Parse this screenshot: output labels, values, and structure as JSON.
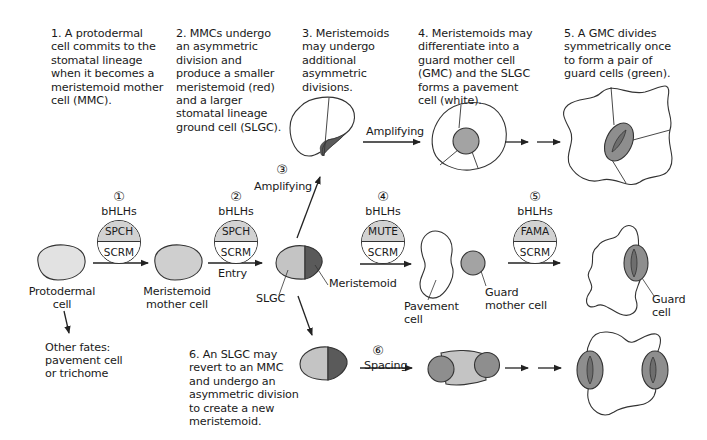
{
  "steps": [
    {
      "id": 1,
      "text": "1. A protodermal\ncell commits to the\nstomatal lineage\nwhen it becomes a\nmeristemoid mother\ncell (MMC)."
    },
    {
      "id": 2,
      "text": "2. MMCs undergo\nan asymmetric\ndivision and\nproduce a smaller\nmeristemoid (red)\nand a larger\nstomatal lineage\nground cell (SLGC)."
    },
    {
      "id": 3,
      "text": "3. Meristemoids\nmay undergo\nadditional\nasymmetric\ndivisions."
    },
    {
      "id": 4,
      "text": "4. Meristemoids may\ndifferentiate into a\nguard mother cell\n(GMC) and the SLGC\nforms a pavement\ncell (white)."
    },
    {
      "id": 5,
      "text": "5. A GMC divides\nsymmetrically once\nto form a pair of\nguard cells (green)."
    },
    {
      "id": 6,
      "text": "6. An SLGC may\nrevert to an MMC\nand undergo an\nasymmetric division\nto create a new\nmeristemoid."
    }
  ],
  "transcription_factors": [
    {
      "marker": "①",
      "group": "bHLHs",
      "top": "SPCH",
      "bottom": "SCRM"
    },
    {
      "marker": "②",
      "group": "bHLHs",
      "top": "SPCH",
      "bottom": "SCRM"
    },
    {
      "marker": "④",
      "group": "bHLHs",
      "top": "MUTE",
      "bottom": "SCRM"
    },
    {
      "marker": "⑤",
      "group": "bHLHs",
      "top": "FAMA",
      "bottom": "SCRM"
    }
  ],
  "arrow_labels": {
    "entry": "Entry",
    "amplifying_marker": "③",
    "amplifying": "Amplifying",
    "amplifying_top": "Amplifying",
    "spacing_marker": "⑥",
    "spacing": "Spacing"
  },
  "cell_labels": {
    "protodermal": "Protodermal\ncell",
    "mmc": "Meristemoid\nmother cell",
    "slgc": "SLGC",
    "meristemoid": "Meristemoid",
    "pavement": "Pavement\ncell",
    "gmc": "Guard\nmother cell",
    "guard": "Guard\ncell",
    "other_fates": "Other fates:\npavement cell\nor trichome"
  },
  "colors": {
    "protodermal_fill": "#e2e2e2",
    "mmc_fill": "#cfcfcf",
    "slgc_fill": "#c4c4c4",
    "meristemoid_fill": "#5a5a5a",
    "gmc_fill": "#a3a3a3",
    "guard_fill": "#8e8e8e",
    "outline": "#333333"
  }
}
